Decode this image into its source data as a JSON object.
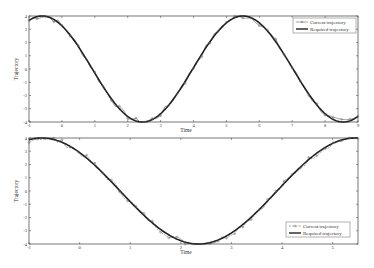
{
  "chart_data": [
    {
      "type": "line",
      "title": "",
      "xlabel": "Time",
      "ylabel": "Trajectory",
      "xlim": [
        -1,
        9
      ],
      "ylim": [
        -4,
        4
      ],
      "xticks": [
        -1,
        0,
        1,
        2,
        3,
        4,
        5,
        6,
        7,
        8,
        9
      ],
      "yticks": [
        4,
        3,
        2,
        1,
        0,
        -1,
        -2,
        -3,
        -4
      ],
      "legend_position": "top-right",
      "grid": false,
      "series": [
        {
          "name": "Current trajectory",
          "style": "line-with-markers",
          "function": "4*cos(2*pi*(t+0.6)/6.1) + noise",
          "x_range": [
            -1,
            9
          ]
        },
        {
          "name": "Required trajectory",
          "style": "solid-thick",
          "function": "4*cos(2*pi*(t+0.6)/6.1)",
          "x_range": [
            -1,
            9
          ]
        }
      ],
      "key_points": {
        "maxima_t": [
          -0.6,
          5.5
        ],
        "minima_t": [
          2.45,
          8.6
        ],
        "amplitude": 4
      }
    },
    {
      "type": "line",
      "title": "",
      "xlabel": "Time",
      "ylabel": "Trajectory",
      "xlim": [
        -1,
        5.5
      ],
      "ylim": [
        -4,
        4
      ],
      "xticks": [
        -1,
        0,
        1,
        2,
        3,
        4,
        5
      ],
      "yticks": [
        4,
        3,
        2,
        1,
        0,
        -1,
        -2,
        -3,
        -4
      ],
      "legend_position": "bottom-right",
      "grid": false,
      "series": [
        {
          "name": "Current trajectory",
          "style": "dashed-with-markers",
          "function": "4*cos(2*pi*(t+0.75)/6.2) + noise",
          "x_range": [
            -1,
            5.5
          ]
        },
        {
          "name": "Required trajectory",
          "style": "solid-thick",
          "function": "4*cos(2*pi*(t+0.75)/6.2)",
          "x_range": [
            -1,
            5.5
          ]
        }
      ],
      "key_points": {
        "maxima_t": [
          -0.75,
          5.45
        ],
        "minima_t": [
          2.35
        ],
        "amplitude": 4
      }
    }
  ],
  "legend": {
    "current": "Current trajectory",
    "required": "Required trajectory"
  },
  "labels": {
    "xlabel": "Time",
    "ylabel": "Trajectory"
  }
}
